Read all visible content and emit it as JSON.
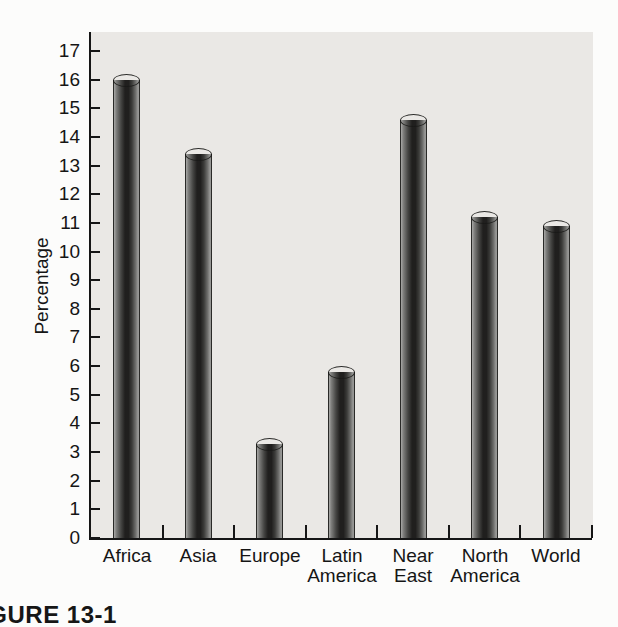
{
  "figure": {
    "caption_fragment": "FIGURE 13-1"
  },
  "chart_data": {
    "type": "bar",
    "title": "",
    "xlabel": "",
    "ylabel": "Percentage",
    "categories": [
      "Africa",
      "Asia",
      "Europe",
      "Latin America",
      "Near East",
      "North America",
      "World"
    ],
    "category_label_lines": [
      [
        "Africa"
      ],
      [
        "Asia"
      ],
      [
        "Europe"
      ],
      [
        "Latin",
        "America"
      ],
      [
        "Near",
        "East"
      ],
      [
        "North",
        "America"
      ],
      [
        "World"
      ]
    ],
    "values": [
      16.2,
      13.6,
      3.5,
      6.0,
      14.8,
      11.4,
      11.1
    ],
    "ylim": [
      0,
      17
    ],
    "ytick_step": 1,
    "yticks": [
      0,
      1,
      2,
      3,
      4,
      5,
      6,
      7,
      8,
      9,
      10,
      11,
      12,
      13,
      14,
      15,
      16,
      17
    ],
    "grid": false,
    "legend": "none",
    "colors": {
      "plot_background": "#eae8e5",
      "axis": "#161616",
      "bar_dark": "#201f1e",
      "bar_light": "#a8a8a6",
      "text": "#151515"
    }
  }
}
